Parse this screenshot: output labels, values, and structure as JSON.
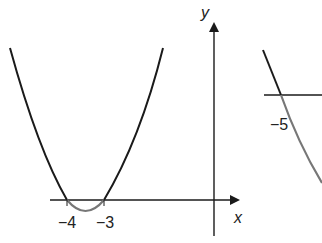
{
  "figure": {
    "left_graph": {
      "axes": {
        "x_label": "x",
        "y_label": "y"
      },
      "root_labels": [
        "−4",
        "−3"
      ],
      "curve": "upward parabola with roots at x = -4 and x = -3; segment between roots shown in grey below the x-axis"
    },
    "right_graph": {
      "root_labels": [
        "−5"
      ],
      "curve": "decreasing curve crossing horizontal axis at x = -5; portion below axis shown in grey"
    },
    "colors": {
      "line": "#1a1a1a",
      "highlight": "#777777",
      "background": "#ffffff"
    }
  }
}
